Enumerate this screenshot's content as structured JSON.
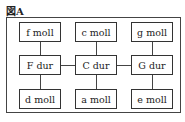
{
  "figure": {
    "label": "図A",
    "top_row": [
      "f moll",
      "c moll",
      "g moll"
    ],
    "middle_row": [
      "F dur",
      "C dur",
      "G dur"
    ],
    "bottom_row": [
      "d moll",
      "a moll",
      "e moll"
    ]
  }
}
